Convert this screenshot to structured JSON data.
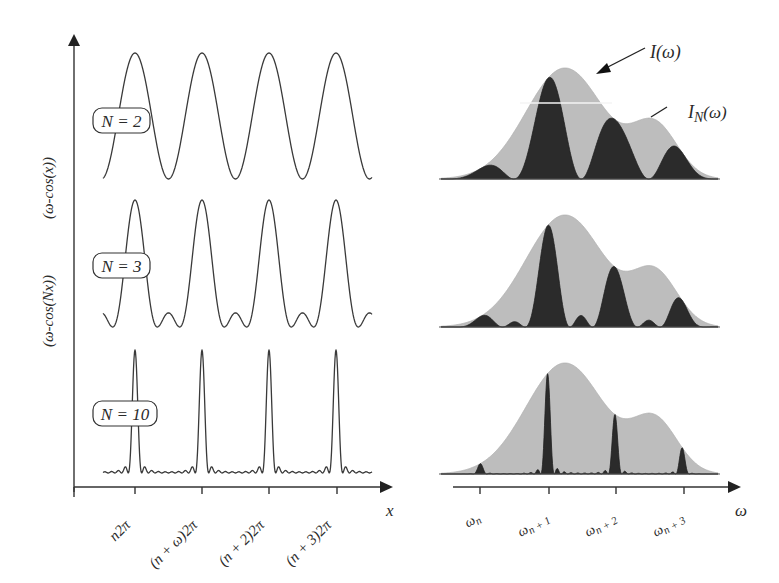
{
  "colors": {
    "ink": "#333333",
    "envelope_fill": "#bdbdbd",
    "peak_fill": "#2b2b2b",
    "background": "#ffffff"
  },
  "left_panel": {
    "y_axis_labels": [
      "(ω-cos(x))",
      "(ω-cos(Nx))"
    ],
    "x_axis_label": "x",
    "x_tick_labels": [
      "n2π",
      "(n + ω)2π",
      "(n + 2)2π",
      "(n + 3)2π"
    ],
    "traces": [
      {
        "label": "N = 2",
        "N": 2
      },
      {
        "label": "N = 3",
        "N": 3
      },
      {
        "label": "N = 10",
        "N": 10
      }
    ]
  },
  "right_panel": {
    "x_axis_label": "ω",
    "x_tick_labels": [
      "ω_n",
      "ω_n+1",
      "ω_n+2",
      "ω_n+3"
    ],
    "x_tick_main": [
      "ω",
      "ω",
      "ω",
      "ω"
    ],
    "x_tick_sub": [
      "n",
      "n + 1",
      "n + 2",
      "n + 3"
    ],
    "annotations": {
      "envelope_label": "I(ω)",
      "envelope_label_main": "I(ω)",
      "filtered_label": "I_N(ω)",
      "filtered_label_main": "I",
      "filtered_label_sub": "N",
      "filtered_label_tail": "(ω)"
    },
    "spectra": [
      {
        "N": 2
      },
      {
        "N": 3
      },
      {
        "N": 10
      }
    ]
  }
}
